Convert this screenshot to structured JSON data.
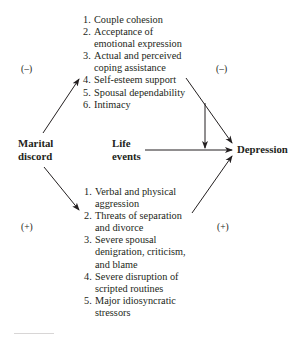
{
  "diagram": {
    "nodes": {
      "source": {
        "line1": "Marital",
        "line2": "discord"
      },
      "moderator": {
        "line1": "Life",
        "line2": "events"
      },
      "outcome": {
        "label": "Depression"
      }
    },
    "upper_path": {
      "sign_left": "(–)",
      "sign_right": "(–)",
      "items": [
        {
          "num": "1.",
          "text": "Couple cohesion"
        },
        {
          "num": "2.",
          "text": "Acceptance of",
          "cont": "emotional expression"
        },
        {
          "num": "3.",
          "text": "Actual and perceived",
          "cont": "coping assistance"
        },
        {
          "num": "4.",
          "text": "Self-esteem support"
        },
        {
          "num": "5.",
          "text": "Spousal dependability"
        },
        {
          "num": "6.",
          "text": "Intimacy"
        }
      ]
    },
    "lower_path": {
      "sign_left": "(+)",
      "sign_right": "(+)",
      "items": [
        {
          "num": "1.",
          "text": "Verbal and physical",
          "cont": "aggression"
        },
        {
          "num": "2.",
          "text": "Threats of separation",
          "cont": "and divorce"
        },
        {
          "num": "3.",
          "text": "Severe spousal",
          "cont": "denigration, criticism,",
          "cont2": "and blame"
        },
        {
          "num": "4.",
          "text": "Severe disruption of",
          "cont": "scripted routines"
        },
        {
          "num": "5.",
          "text": "Major idiosyncratic",
          "cont": "stressors"
        }
      ]
    },
    "edges": [
      {
        "from": "Marital discord",
        "to": "Upper mediators",
        "sign": "–"
      },
      {
        "from": "Upper mediators",
        "to": "Depression",
        "sign": "–"
      },
      {
        "from": "Marital discord",
        "to": "Lower mediators",
        "sign": "+"
      },
      {
        "from": "Lower mediators",
        "to": "Depression",
        "sign": "+"
      },
      {
        "from": "Life events",
        "to": "Depression"
      },
      {
        "from": "Upper mediators",
        "to": "Life events → Depression path",
        "type": "moderation"
      }
    ],
    "colors": {
      "ink": "#231f20",
      "background": "#ffffff"
    }
  }
}
